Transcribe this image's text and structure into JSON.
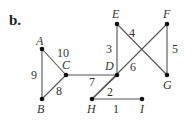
{
  "figure_label": "b.",
  "nodes": [
    {
      "id": "A",
      "x": 42,
      "y": 49,
      "lx": 36,
      "ly": 45
    },
    {
      "id": "B",
      "x": 42,
      "y": 99,
      "lx": 37,
      "ly": 113
    },
    {
      "id": "C",
      "x": 66,
      "y": 75,
      "lx": 62,
      "ly": 69
    },
    {
      "id": "D",
      "x": 117,
      "y": 75,
      "lx": 105,
      "ly": 70
    },
    {
      "id": "E",
      "x": 117,
      "y": 24,
      "lx": 112,
      "ly": 18
    },
    {
      "id": "F",
      "x": 167,
      "y": 24,
      "lx": 163,
      "ly": 18
    },
    {
      "id": "G",
      "x": 167,
      "y": 75,
      "lx": 163,
      "ly": 89
    },
    {
      "id": "H",
      "x": 92,
      "y": 99,
      "lx": 87,
      "ly": 113
    },
    {
      "id": "I",
      "x": 142,
      "y": 99,
      "lx": 140,
      "ly": 113
    }
  ],
  "edges": [
    {
      "from": "A",
      "to": "C",
      "weight": "10",
      "lx": 57,
      "ly": 57
    },
    {
      "from": "A",
      "to": "B",
      "weight": "9",
      "lx": 31,
      "ly": 79
    },
    {
      "from": "B",
      "to": "C",
      "weight": "8",
      "lx": 56,
      "ly": 95
    },
    {
      "from": "C",
      "to": "D",
      "weight": "7",
      "lx": 89,
      "ly": 86
    },
    {
      "from": "E",
      "to": "D",
      "weight": "3",
      "lx": 106,
      "ly": 53
    },
    {
      "from": "E",
      "to": "G",
      "weight": "4",
      "lx": 129,
      "ly": 37
    },
    {
      "from": "F",
      "to": "H",
      "weight": "6",
      "lx": 130,
      "ly": 71
    },
    {
      "from": "F",
      "to": "G",
      "weight": "5",
      "lx": 172,
      "ly": 53
    },
    {
      "from": "H",
      "to": "I",
      "weight": "1",
      "lx": 113,
      "ly": 113
    },
    {
      "from": "D",
      "to": "H",
      "weight": "2",
      "lx": 107,
      "ly": 96
    }
  ]
}
